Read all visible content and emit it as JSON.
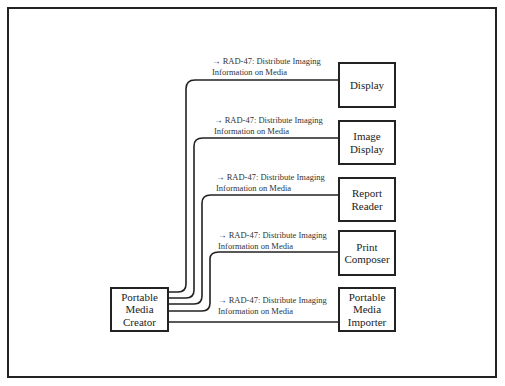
{
  "diagram": {
    "source_actor": {
      "label": "Portable\nMedia\nCreator"
    },
    "targets": [
      {
        "label": "Display"
      },
      {
        "label": "Image\nDisplay"
      },
      {
        "label": "Report\nReader"
      },
      {
        "label": "Print\nComposer"
      },
      {
        "label": "Portable\nMedia\nImporter"
      }
    ],
    "transactions": [
      {
        "line1": "→ RAD-47: Distribute Imaging",
        "line2": "Information on Media"
      },
      {
        "line1": "→ RAD-47: Distribute Imaging",
        "line2": "Information on Media"
      },
      {
        "line1": "→ RAD-47: Distribute Imaging",
        "line2": "Information on Media"
      },
      {
        "line1": "→ RAD-47: Distribute Imaging",
        "line2": "Information on Media"
      },
      {
        "line1": "→ RAD-47: Distribute Imaging",
        "line2": "Information on Media"
      }
    ]
  }
}
